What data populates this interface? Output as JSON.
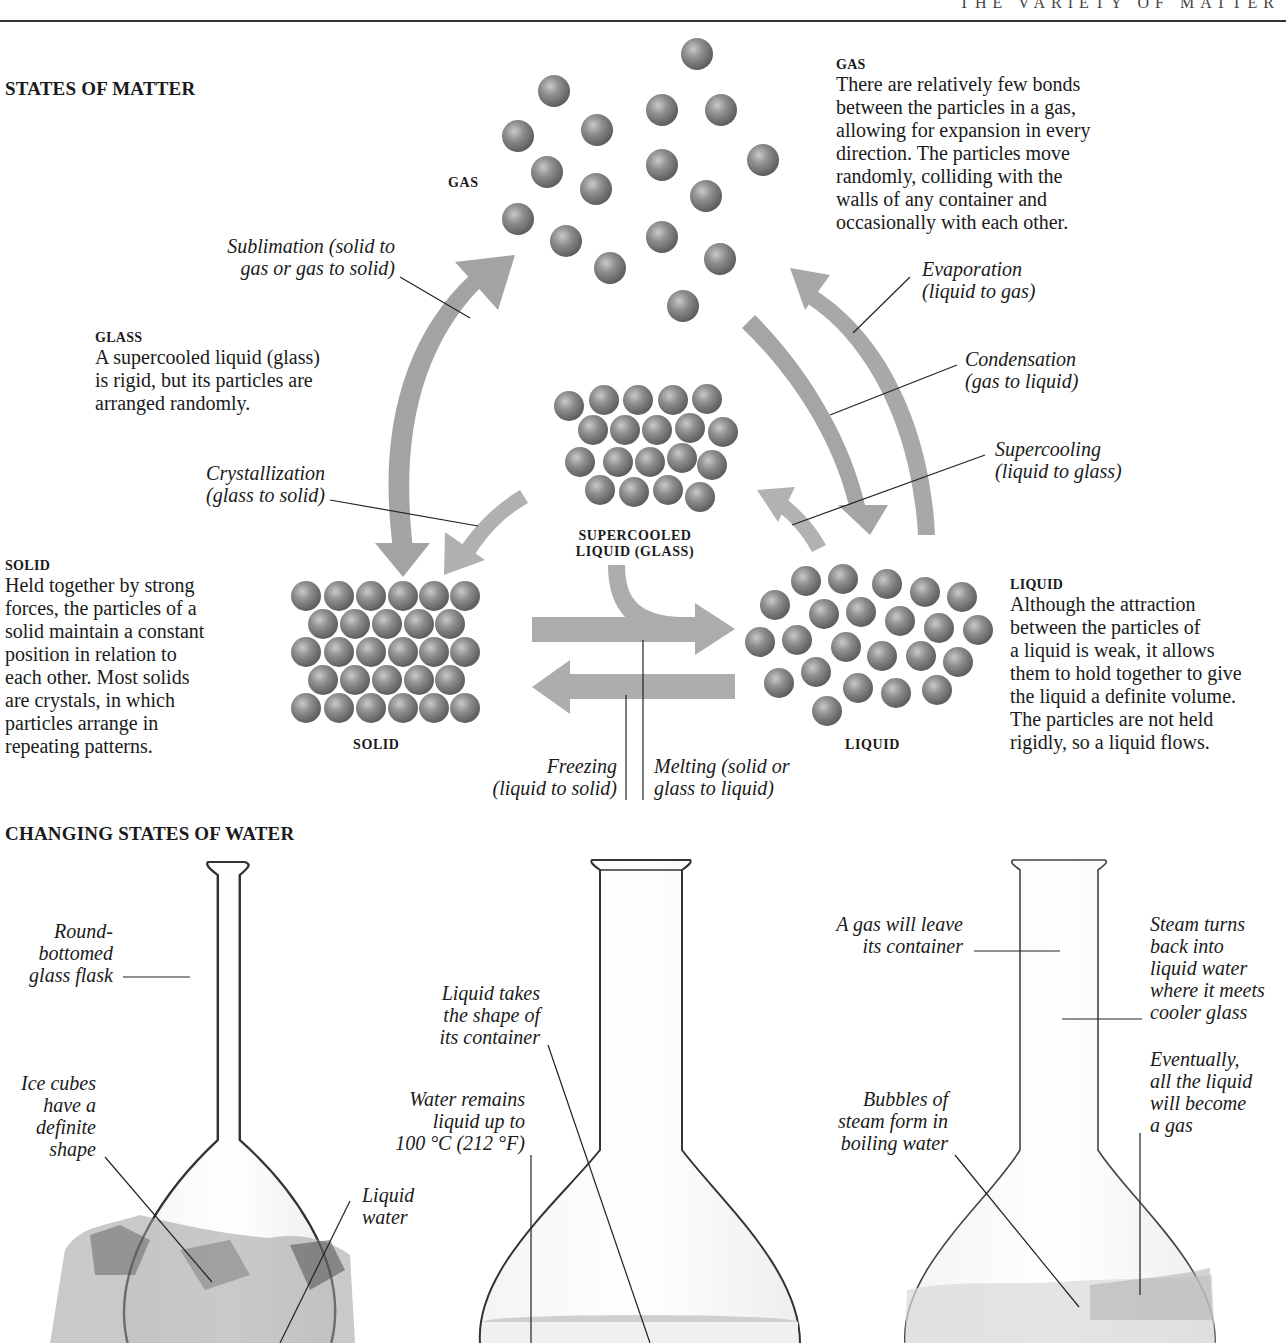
{
  "page": {
    "running_head": "THE VARIETY OF MATTER"
  },
  "states_of_matter": {
    "title": "STATES OF MATTER",
    "gas": {
      "label": "GAS",
      "caption_head": "GAS",
      "caption": [
        "There are relatively few bonds",
        "between the particles in a gas,",
        "allowing for expansion in every",
        "direction. The particles move",
        "randomly, colliding with the",
        "walls of any container and",
        "occasionally with each other."
      ]
    },
    "glass": {
      "label": [
        "SUPERCOOLED",
        "LIQUID (GLASS)"
      ],
      "caption_head": "GLASS",
      "caption": [
        "A supercooled liquid (glass)",
        "is rigid, but its particles are",
        "arranged randomly."
      ]
    },
    "solid": {
      "label": "SOLID",
      "caption_head": "SOLID",
      "caption": [
        "Held together by strong",
        "forces, the particles of a",
        "solid maintain a constant",
        "position in relation to",
        "each other. Most solids",
        "are crystals, in which",
        "particles arrange in",
        "repeating patterns."
      ]
    },
    "liquid": {
      "label": "LIQUID",
      "caption_head": "LIQUID",
      "caption": [
        "Although the attraction",
        "between the particles of",
        "a liquid is weak, it allows",
        "them to hold together to give",
        "the liquid a definite volume.",
        "The particles are not held",
        "rigidly, so a liquid flows."
      ]
    },
    "transitions": {
      "sublimation": [
        "Sublimation (solid to",
        "gas or gas to solid)"
      ],
      "evaporation": [
        "Evaporation",
        "(liquid to gas)"
      ],
      "condensation": [
        "Condensation",
        "(gas to liquid)"
      ],
      "supercooling": [
        "Supercooling",
        "(liquid to glass)"
      ],
      "crystallization": [
        "Crystallization",
        "(glass to solid)"
      ],
      "freezing": [
        "Freezing",
        "(liquid to solid)"
      ],
      "melting": [
        "Melting (solid or",
        "glass to liquid)"
      ]
    },
    "colors": {
      "particle": "#8a8a8a",
      "arrow": "#a9a9a9",
      "leader_line": "#222222"
    }
  },
  "changing_states_of_water": {
    "title": "CHANGING STATES OF WATER",
    "flask_ice": {
      "labels": {
        "flask": [
          "Round-",
          "bottomed",
          "glass flask"
        ],
        "ice": [
          "Ice cubes",
          "have a",
          "definite",
          "shape"
        ],
        "liquid_water": [
          "Liquid",
          "water"
        ]
      }
    },
    "flask_liquid": {
      "labels": {
        "shape": [
          "Liquid takes",
          "the shape of",
          "its container"
        ],
        "remains": [
          "Water remains",
          "liquid up to",
          "100 °C (212 °F)"
        ]
      }
    },
    "flask_gas": {
      "labels": {
        "leave": [
          "A gas will leave",
          "its container"
        ],
        "steam_turns": [
          "Steam turns",
          "back into",
          "liquid water",
          "where it meets",
          "cooler glass"
        ],
        "eventually": [
          "Eventually,",
          "all the liquid",
          "will become",
          "a gas"
        ],
        "bubbles": [
          "Bubbles of",
          "steam form in",
          "boiling water"
        ]
      }
    }
  }
}
